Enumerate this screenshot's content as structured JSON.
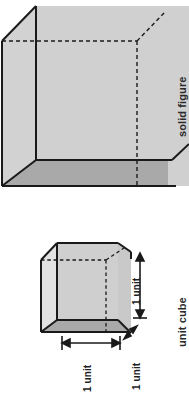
{
  "figure": {
    "title_solid": "solid figure",
    "title_unit": "unit cube",
    "solid_figure": {
      "label": "solid figure",
      "shape": "cube",
      "top_face_color": "#d2d2d2",
      "front_face_color": "#cccccc",
      "bottom_face_color": "#a9a9a9",
      "edge_color": "#1a1a1a",
      "hidden_edge_style": "dashed"
    },
    "unit_cube": {
      "label": "unit cube",
      "shape": "cube",
      "top_face_color": "#d2d2d2",
      "front_face_color": "#cccccc",
      "bottom_face_color": "#a9a9a9",
      "edge_color": "#1a1a1a",
      "hidden_edge_style": "dashed",
      "dimensions": [
        {
          "name": "width",
          "value": "1 unit"
        },
        {
          "name": "depth",
          "value": "1 unit"
        },
        {
          "name": "height",
          "value": "1 unit"
        }
      ]
    }
  },
  "colors": {
    "background": "#ffffff",
    "ink": "#1a1a1a",
    "text": "#2b2b2b",
    "light_face": "#d2d2d2",
    "mid_face": "#cccccc",
    "dark_face": "#a9a9a9"
  }
}
